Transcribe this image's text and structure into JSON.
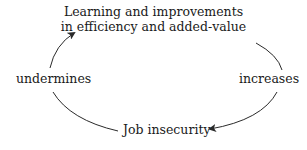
{
  "diagram": {
    "nodes": {
      "top": {
        "line1": "Learning and improvements",
        "line2": "in efficiency and added-value"
      },
      "bottom": "Job insecurity"
    },
    "edges": {
      "right": "increases",
      "left": "undermines"
    },
    "colors": {
      "text": "#1a1a1a",
      "arrow": "#2a2a2a",
      "background": "#ffffff"
    }
  }
}
